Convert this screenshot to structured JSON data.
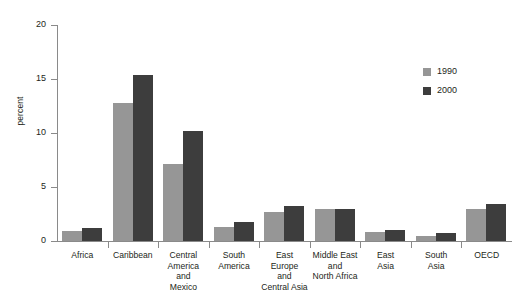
{
  "chart_data": {
    "type": "bar",
    "title": "",
    "xlabel": "",
    "ylabel": "percent",
    "ylim": [
      0,
      20
    ],
    "yticks": [
      0,
      5,
      10,
      15,
      20
    ],
    "grid": false,
    "legend_position": "top-right",
    "categories": [
      "Africa",
      "Caribbean",
      "Central\nAmerica\nand\nMexico",
      "South\nAmerica",
      "East\nEurope\nand\nCentral Asia",
      "Middle East\nand\nNorth Africa",
      "East\nAsia",
      "South\nAsia",
      "OECD"
    ],
    "series": [
      {
        "name": "1990",
        "color": "#969696",
        "values": [
          0.9,
          12.8,
          7.1,
          1.3,
          2.65,
          2.95,
          0.8,
          0.5,
          3.0
        ]
      },
      {
        "name": "2000",
        "color": "#3d3d3d",
        "values": [
          1.2,
          15.4,
          10.2,
          1.75,
          3.2,
          2.95,
          1.05,
          0.75,
          3.4
        ]
      }
    ]
  },
  "axis": {
    "y_title": "percent",
    "tick_labels": [
      "0",
      "5",
      "10",
      "15",
      "20"
    ]
  },
  "legend": {
    "items": [
      {
        "label": "1990",
        "color": "#969696"
      },
      {
        "label": "2000",
        "color": "#3d3d3d"
      }
    ]
  },
  "colors": {
    "series_1990": "#969696",
    "series_2000": "#3d3d3d",
    "axis": "#8a8a8a",
    "text": "#231f20",
    "background": "#ffffff"
  }
}
